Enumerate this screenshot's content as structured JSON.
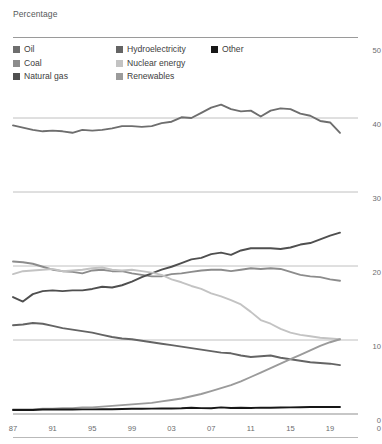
{
  "header": {
    "axis_title": "Percentage"
  },
  "legend": {
    "columns": [
      {
        "items": [
          {
            "label": "Oil",
            "color": "#6e6e6e"
          },
          {
            "label": "Coal",
            "color": "#8c8c8c"
          },
          {
            "label": "Natural gas",
            "color": "#4f4f4f"
          }
        ]
      },
      {
        "items": [
          {
            "label": "Hydroelectricity",
            "color": "#646464"
          },
          {
            "label": "Nuclear energy",
            "color": "#c3c3c3"
          },
          {
            "label": "Renewables",
            "color": "#9b9b9b"
          }
        ]
      },
      {
        "items": [
          {
            "label": "Other",
            "color": "#171717"
          }
        ]
      }
    ]
  },
  "chart_data": {
    "type": "line",
    "title": "",
    "subtitle": "",
    "xlabel": "",
    "ylabel": "Percentage",
    "xlim": [
      1987,
      2020
    ],
    "ylim": [
      0,
      50
    ],
    "grid": true,
    "gridlines": [
      0,
      10,
      20,
      30,
      40,
      50
    ],
    "legend_position": "top",
    "x": [
      1987,
      1988,
      1989,
      1990,
      1991,
      1992,
      1993,
      1994,
      1995,
      1996,
      1997,
      1998,
      1999,
      2000,
      2001,
      2002,
      2003,
      2004,
      2005,
      2006,
      2007,
      2008,
      2009,
      2010,
      2011,
      2012,
      2013,
      2014,
      2015,
      2016,
      2017,
      2018,
      2019,
      2020
    ],
    "xticks": [
      1987,
      1991,
      1995,
      1999,
      2003,
      2007,
      2011,
      2015,
      2019
    ],
    "xticklabels": [
      "87",
      "91",
      "95",
      "99",
      "03",
      "07",
      "11",
      "15",
      "19"
    ],
    "yticks": [
      0,
      10,
      20,
      30,
      40,
      50
    ],
    "yticklabels": [
      "0",
      "10",
      "20",
      "30",
      "40",
      "50"
    ],
    "series": [
      {
        "name": "Oil",
        "color": "#6e6e6e",
        "values": [
          39.0,
          38.7,
          38.4,
          38.2,
          38.3,
          38.2,
          38.0,
          38.4,
          38.3,
          38.4,
          38.6,
          38.9,
          38.9,
          38.8,
          38.9,
          39.3,
          39.5,
          40.1,
          40.0,
          40.7,
          41.4,
          41.8,
          41.2,
          40.9,
          41.0,
          40.2,
          41.0,
          41.3,
          41.2,
          40.6,
          40.3,
          39.6,
          39.4,
          38.0
        ]
      },
      {
        "name": "Coal",
        "color": "#8c8c8c",
        "values": [
          20.6,
          20.5,
          20.3,
          19.9,
          19.5,
          19.3,
          19.2,
          19.0,
          19.4,
          19.5,
          19.3,
          19.3,
          19.0,
          18.8,
          18.6,
          18.6,
          18.9,
          19.0,
          19.2,
          19.4,
          19.5,
          19.5,
          19.3,
          19.5,
          19.7,
          19.6,
          19.7,
          19.6,
          19.2,
          18.8,
          18.6,
          18.5,
          18.2,
          18.0
        ]
      },
      {
        "name": "Natural gas",
        "color": "#4f4f4f",
        "values": [
          15.8,
          15.2,
          16.2,
          16.6,
          16.7,
          16.6,
          16.7,
          16.7,
          16.9,
          17.2,
          17.1,
          17.4,
          17.9,
          18.5,
          19.0,
          19.5,
          19.9,
          20.4,
          20.9,
          21.1,
          21.6,
          21.8,
          21.5,
          22.1,
          22.4,
          22.4,
          22.4,
          22.3,
          22.5,
          22.9,
          23.1,
          23.6,
          24.1,
          24.5
        ]
      },
      {
        "name": "Hydroelectricity",
        "color": "#646464",
        "values": [
          12.0,
          12.1,
          12.3,
          12.2,
          11.9,
          11.6,
          11.4,
          11.2,
          11.0,
          10.7,
          10.4,
          10.2,
          10.1,
          9.9,
          9.7,
          9.5,
          9.3,
          9.1,
          8.9,
          8.7,
          8.5,
          8.3,
          8.2,
          7.9,
          7.7,
          7.8,
          7.9,
          7.6,
          7.4,
          7.2,
          7.0,
          6.9,
          6.8,
          6.6
        ]
      },
      {
        "name": "Nuclear energy",
        "color": "#c3c3c3",
        "values": [
          18.9,
          19.3,
          19.4,
          19.5,
          19.6,
          19.3,
          19.4,
          19.5,
          19.7,
          19.8,
          19.5,
          19.4,
          19.5,
          19.3,
          19.1,
          18.8,
          18.2,
          17.8,
          17.3,
          16.9,
          16.3,
          15.9,
          15.4,
          14.8,
          13.8,
          12.7,
          12.2,
          11.5,
          11.0,
          10.7,
          10.5,
          10.3,
          10.2,
          10.1
        ]
      },
      {
        "name": "Renewables",
        "color": "#9b9b9b",
        "values": [
          0.6,
          0.6,
          0.6,
          0.7,
          0.7,
          0.8,
          0.8,
          0.9,
          0.9,
          1.0,
          1.1,
          1.2,
          1.3,
          1.4,
          1.5,
          1.7,
          1.9,
          2.1,
          2.4,
          2.7,
          3.1,
          3.5,
          3.9,
          4.4,
          5.0,
          5.6,
          6.2,
          6.8,
          7.4,
          8.0,
          8.6,
          9.2,
          9.7,
          10.1
        ]
      },
      {
        "name": "Other",
        "color": "#171717",
        "values": [
          0.55,
          0.55,
          0.55,
          0.6,
          0.6,
          0.6,
          0.6,
          0.62,
          0.62,
          0.65,
          0.65,
          0.68,
          0.7,
          0.7,
          0.72,
          0.75,
          0.75,
          0.78,
          0.85,
          0.8,
          0.78,
          0.9,
          0.82,
          0.85,
          0.82,
          0.86,
          0.85,
          0.88,
          0.9,
          0.92,
          0.95,
          0.95,
          0.95,
          0.95
        ]
      }
    ]
  }
}
